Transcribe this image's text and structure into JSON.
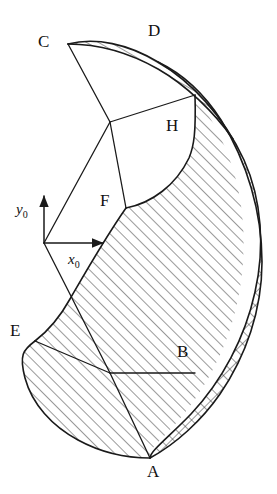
{
  "figure": {
    "background_color": "#ffffff",
    "stroke_color": "#1a1a1a",
    "width": 277,
    "height": 494
  },
  "axes": {
    "origin": {
      "x": 44,
      "y": 243
    },
    "y_axis": {
      "label": "y",
      "subscript": "0",
      "tip_x": 44,
      "tip_y": 196,
      "label_x": 16,
      "label_y": 214
    },
    "x_axis": {
      "label": "x",
      "subscript": "0",
      "tip_x": 103,
      "tip_y": 243,
      "label_x": 68,
      "label_y": 264
    }
  },
  "points": [
    {
      "id": "C",
      "label": "C",
      "label_x": 38,
      "label_y": 47,
      "vertex_x": 68,
      "vertex_y": 44
    },
    {
      "id": "D",
      "label": "D",
      "label_x": 148,
      "label_y": 36,
      "vertex_x": 150,
      "vertex_y": 45
    },
    {
      "id": "H",
      "label": "H",
      "label_x": 166,
      "label_y": 131,
      "vertex_x": 193,
      "vertex_y": 120
    },
    {
      "id": "F",
      "label": "F",
      "label_x": 100,
      "label_y": 206,
      "vertex_x": 126,
      "vertex_y": 208
    },
    {
      "id": "E",
      "label": "E",
      "label_x": 10,
      "label_y": 336,
      "vertex_x": 35,
      "vertex_y": 341
    },
    {
      "id": "B",
      "label": "B",
      "label_x": 177,
      "label_y": 357,
      "vertex_x": 195,
      "vertex_y": 373
    },
    {
      "id": "A",
      "label": "A",
      "label_x": 147,
      "label_y": 477,
      "vertex_x": 150,
      "vertex_y": 458
    }
  ],
  "regions": {
    "thin_crescent_CD": {
      "name": "thin-hatched-crescent-top",
      "hatch": "diagonal",
      "path": "M 68,44 C 96,37 128,44 158,62 C 186,79 214,106 233,139 C 214,112 186,85 158,69 C 128,52 96,44 68,44 Z"
    },
    "cross_hatched_band": {
      "name": "cross-hatched-outer-band",
      "hatch": "cross",
      "path": "M 158,62 C 192,82 224,117 244,160 C 262,200 265,248 255,292 C 245,338 222,381 191,414 C 170,436 150,451 150,458 C 176,444 202,420 220,394 C 246,356 262,310 262,262 C 262,212 247,162 221,120 C 203,92 181,73 158,62 Z"
    },
    "main_hatched_body": {
      "name": "main-hatched-body",
      "hatch": "diagonal",
      "path": "M 126,208 C 152,203 176,185 189,158 C 194,146 196,133 195,95 C 212,118 228,148 236,180 C 247,224 246,272 234,316 C 222,360 199,400 168,432 C 150,450 150,451 150,458 C 126,458 100,452 78,440 C 52,426 32,404 25,378 C 19,355 23,350 35,341 C 48,331 60,317 70,299 C 88,268 105,238 126,208 Z"
    }
  },
  "construction_lines": [
    {
      "name": "line-C-to-crossing",
      "x1": 68,
      "y1": 44,
      "x2": 110,
      "y2": 122
    },
    {
      "name": "line-crossing-to-H-arc",
      "x1": 110,
      "y1": 122,
      "x2": 195,
      "y2": 95
    },
    {
      "name": "line-crossing-to-F",
      "x1": 110,
      "y1": 122,
      "x2": 126,
      "y2": 208
    },
    {
      "name": "line-origin-to-crossing",
      "x1": 44,
      "y1": 243,
      "x2": 110,
      "y2": 122
    },
    {
      "name": "line-origin-to-E-junction",
      "x1": 44,
      "y1": 243,
      "x2": 110,
      "y2": 373
    },
    {
      "name": "line-E-to-junction",
      "x1": 35,
      "y1": 341,
      "x2": 110,
      "y2": 373
    },
    {
      "name": "line-junction-to-B",
      "x1": 110,
      "y1": 373,
      "x2": 195,
      "y2": 373
    },
    {
      "name": "line-junction-to-A",
      "x1": 110,
      "y1": 373,
      "x2": 150,
      "y2": 458
    }
  ],
  "boundary_arcs": [
    {
      "name": "arc-outer-right",
      "path": "M 150,458 C 176,444 202,420 220,394 C 246,356 262,310 262,262 C 262,212 247,162 221,120 C 203,92 181,73 158,62 C 128,44 96,37 68,44"
    },
    {
      "name": "arc-inner-of-band",
      "path": "M 158,62 C 192,82 224,117 244,160 C 262,200 265,248 255,292 C 245,338 222,381 191,414 C 170,436 150,451 150,458"
    },
    {
      "name": "arc-thin-crescent-lower",
      "path": "M 68,44 C 96,44 128,52 158,69 C 186,85 214,112 233,139"
    },
    {
      "name": "arc-concave-F-to-H",
      "path": "M 126,208 C 152,203 176,185 189,158 C 194,146 196,133 195,95"
    },
    {
      "name": "arc-bottom-left-lobe",
      "path": "M 35,341 C 23,350 19,355 25,378 C 32,404 52,426 78,440 C 100,452 126,458 150,458"
    },
    {
      "name": "arc-F-down-left",
      "path": "M 126,208 C 105,238 88,268 70,299 C 60,317 48,331 35,341"
    }
  ],
  "crossing_point": {
    "name": "upper-crossing",
    "x": 110,
    "y": 122
  },
  "lower_junction": {
    "name": "lower-junction",
    "x": 110,
    "y": 373
  }
}
